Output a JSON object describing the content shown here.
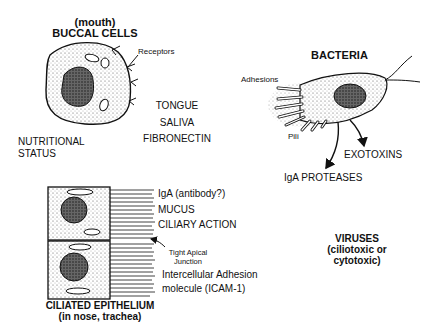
{
  "buccal": {
    "subtitle": "(mouth)",
    "title": "BUCCAL CELLS",
    "receptors_label": "Receptors",
    "factors": [
      "TONGUE",
      "SALIVA",
      "FIBRONECTIN"
    ],
    "nutritional_1": "NUTRITIONAL",
    "nutritional_2": "STATUS"
  },
  "bacteria": {
    "title": "BACTERIA",
    "adhesions_label": "Adhesions",
    "pili_label": "Pili",
    "exotoxins": "EXOTOXINS",
    "iga_proteases": "IgA PROTEASES"
  },
  "epithelium": {
    "factors": [
      "IgA (antibody?)",
      "MUCUS",
      "CILIARY ACTION"
    ],
    "junction_1": "Tight Apical",
    "junction_2": "Junction",
    "icam_1": "Intercellular Adhesion",
    "icam_2": "molecule (ICAM-1)",
    "title": "CILIATED  EPITHELIUM",
    "subtitle": "(in nose, trachea)"
  },
  "viruses": {
    "title": "VIRUSES",
    "line1": "(ciliotoxic or",
    "line2": "cytotoxic)"
  }
}
